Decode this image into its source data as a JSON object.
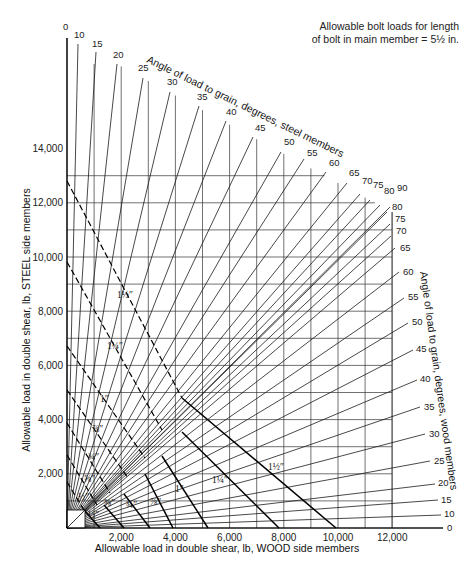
{
  "note": {
    "line1": "Allowable bolt loads for length",
    "line2": "of bolt in main member = 5½ in."
  },
  "chart_data": {
    "type": "line",
    "subtype": "nomograph",
    "title": "Allowable bolt loads for length of bolt in main member = 5½ in.",
    "xlabel": "Allowable load in double shear, lb, WOOD side members",
    "ylabel": "Allowable load in double shear, lb, STEEL side members",
    "steel_angle_title": "Angle of load to grain, degrees, steel members",
    "wood_angle_title": "Angle of load to grain, degrees, wood members",
    "xlim": [
      0,
      13000
    ],
    "ylim": [
      0,
      16500
    ],
    "x_ticks": [
      2000,
      4000,
      6000,
      8000,
      10000,
      12000
    ],
    "x_tick_labels": [
      "2,000",
      "4,000",
      "6,000",
      "8,000",
      "10,000",
      "12,000"
    ],
    "y_ticks": [
      2000,
      4000,
      6000,
      8000,
      10000,
      12000,
      14000
    ],
    "y_tick_labels": [
      "2,000",
      "4,000",
      "6,000",
      "8,000",
      "10,000",
      "12,000",
      "14,000"
    ],
    "grid": true,
    "grid_step": 1000,
    "steel_angles": [
      "0",
      "10",
      "15",
      "20",
      "25",
      "30",
      "35",
      "40",
      "45",
      "50",
      "55",
      "60",
      "65",
      "70",
      "75",
      "80",
      "90"
    ],
    "wood_angles": [
      "0",
      "10",
      "15",
      "20",
      "25",
      "30",
      "35",
      "40",
      "45",
      "50",
      "55",
      "60",
      "65",
      "70",
      "75",
      "80"
    ],
    "bolt_diameters": [
      {
        "label": "½″",
        "steel_intercept": 1000,
        "wood_intercept": 1900
      },
      {
        "label": "⅝″",
        "steel_intercept": 1700,
        "wood_intercept": 2500
      },
      {
        "label": "¾″",
        "steel_intercept": 2700,
        "wood_intercept": 3100
      },
      {
        "label": "⅞″",
        "steel_intercept": 3900,
        "wood_intercept": 3900
      },
      {
        "label": "1″",
        "steel_intercept": 5100,
        "wood_intercept": 5200
      },
      {
        "label": "1¼″",
        "steel_intercept": 6700,
        "wood_intercept": 7800
      },
      {
        "label": "1½″",
        "steel_intercept": 12800,
        "wood_intercept": 10000
      }
    ]
  },
  "geometry": {
    "origin": [
      67,
      528
    ],
    "px_per_1000": 27.1,
    "steel_rays": [
      {
        "label": "0",
        "end": [
          67,
          38
        ],
        "text": [
          63,
          30
        ]
      },
      {
        "label": "10",
        "end": [
          78,
          44
        ],
        "text": [
          74,
          38
        ]
      },
      {
        "label": "15",
        "end": [
          96,
          52
        ],
        "text": [
          92,
          47
        ]
      },
      {
        "label": "20",
        "end": [
          117,
          64
        ],
        "text": [
          113,
          58
        ]
      },
      {
        "label": "25",
        "end": [
          143,
          78
        ],
        "text": [
          138,
          71
        ]
      },
      {
        "label": "30",
        "end": [
          170,
          92
        ],
        "text": [
          167,
          85
        ]
      },
      {
        "label": "35",
        "end": [
          199,
          106
        ],
        "text": [
          197,
          100
        ]
      },
      {
        "label": "40",
        "end": [
          226,
          121
        ],
        "text": [
          226,
          115
        ]
      },
      {
        "label": "45",
        "end": [
          253,
          137
        ],
        "text": [
          255,
          131
        ]
      },
      {
        "label": "50",
        "end": [
          281,
          152
        ],
        "text": [
          284,
          145
        ]
      },
      {
        "label": "55",
        "end": [
          304,
          159
        ],
        "text": [
          307,
          156
        ]
      },
      {
        "label": "60",
        "end": [
          326,
          172
        ],
        "text": [
          329,
          166
        ]
      },
      {
        "label": "65",
        "end": [
          347,
          183
        ],
        "text": [
          349,
          176
        ]
      },
      {
        "label": "70",
        "end": [
          360,
          194
        ],
        "text": [
          362,
          184
        ]
      },
      {
        "label": "75",
        "end": [
          370,
          200
        ],
        "text": [
          373,
          188
        ]
      },
      {
        "label": "80",
        "end": [
          380,
          205
        ],
        "text": [
          384,
          194
        ]
      },
      {
        "label": "90",
        "end": [
          390,
          207
        ],
        "text": [
          397,
          191
        ]
      }
    ],
    "wood_rays": [
      {
        "label": "80",
        "end": [
          387,
          212
        ],
        "text": [
          392,
          210
        ]
      },
      {
        "label": "75",
        "end": [
          390,
          224
        ],
        "text": [
          395,
          222
        ]
      },
      {
        "label": "70",
        "end": [
          391,
          236
        ],
        "text": [
          396,
          234
        ]
      },
      {
        "label": "65",
        "end": [
          395,
          248
        ],
        "text": [
          400,
          251
        ]
      },
      {
        "label": "60",
        "end": [
          399,
          272
        ],
        "text": [
          403,
          275
        ]
      },
      {
        "label": "55",
        "end": [
          404,
          298
        ],
        "text": [
          408,
          300
        ]
      },
      {
        "label": "50",
        "end": [
          408,
          323
        ],
        "text": [
          412,
          325
        ]
      },
      {
        "label": "45",
        "end": [
          413,
          350
        ],
        "text": [
          416,
          352
        ]
      },
      {
        "label": "40",
        "end": [
          417,
          380
        ],
        "text": [
          420,
          382
        ]
      },
      {
        "label": "35",
        "end": [
          420,
          407
        ],
        "text": [
          424,
          410
        ]
      },
      {
        "label": "30",
        "end": [
          425,
          434
        ],
        "text": [
          429,
          437
        ]
      },
      {
        "label": "25",
        "end": [
          430,
          461
        ],
        "text": [
          434,
          464
        ]
      },
      {
        "label": "20",
        "end": [
          435,
          484
        ],
        "text": [
          438,
          486
        ]
      },
      {
        "label": "15",
        "end": [
          438,
          500
        ],
        "text": [
          441,
          503
        ]
      },
      {
        "label": "10",
        "end": [
          441,
          515
        ],
        "text": [
          444,
          517
        ]
      },
      {
        "label": "0",
        "end": [
          443,
          528
        ],
        "text": [
          447,
          531
        ]
      }
    ],
    "bolt_lines": [
      {
        "label": "½″",
        "pts": [
          [
            67,
            501
          ],
          [
            84,
            510
          ],
          [
            90,
            520
          ],
          [
            100,
            528
          ]
        ],
        "dash": [
          [
            67,
            501
          ],
          [
            84,
            510
          ]
        ],
        "lab": [
          88,
          518
        ]
      },
      {
        "label": "⅝″",
        "pts": [
          [
            67,
            482
          ],
          [
            90,
            497
          ],
          [
            104,
            505
          ],
          [
            118,
            520
          ],
          [
            124,
            528
          ]
        ],
        "lab": [
          104,
          506
        ]
      },
      {
        "label": "¾″",
        "pts": [
          [
            67,
            455
          ],
          [
            96,
            479
          ],
          [
            112,
            492
          ],
          [
            140,
            510
          ],
          [
            150,
            528
          ]
        ],
        "lab": [
          126,
          508
        ]
      },
      {
        "label": "⅞″",
        "pts": [
          [
            67,
            423
          ],
          [
            100,
            455
          ],
          [
            125,
            478
          ],
          [
            160,
            500
          ],
          [
            173,
            528
          ]
        ],
        "lab": [
          150,
          505
        ]
      },
      {
        "label": "1″",
        "pts": [
          [
            67,
            390
          ],
          [
            110,
            432
          ],
          [
            147,
            460
          ],
          [
            190,
            500
          ],
          [
            208,
            528
          ]
        ],
        "lab": [
          175,
          492
        ]
      },
      {
        "label": "1¼″",
        "pts": [
          [
            67,
            346
          ],
          [
            128,
            403
          ],
          [
            163,
            430
          ],
          [
            210,
            470
          ],
          [
            279,
            528
          ]
        ],
        "lab": [
          212,
          483
        ]
      },
      {
        "label": "1½″",
        "pts": [
          [
            67,
            181
          ],
          [
            180,
            365
          ],
          [
            185,
            398
          ],
          [
            260,
            460
          ],
          [
            336,
            528
          ]
        ],
        "lab": [
          268,
          470
        ]
      }
    ],
    "dashed_lines": [
      {
        "pts": [
          [
            67,
            181
          ],
          [
            182,
            398
          ]
        ]
      },
      {
        "pts": [
          [
            67,
            262
          ],
          [
            162,
            430
          ]
        ]
      },
      {
        "pts": [
          [
            67,
            346
          ],
          [
            145,
            458
          ]
        ]
      },
      {
        "pts": [
          [
            67,
            390
          ],
          [
            128,
            478
          ]
        ]
      },
      {
        "pts": [
          [
            67,
            423
          ],
          [
            110,
            493
          ]
        ]
      },
      {
        "pts": [
          [
            67,
            455
          ],
          [
            97,
            505
          ]
        ]
      },
      {
        "pts": [
          [
            67,
            482
          ],
          [
            84,
            510
          ]
        ]
      }
    ],
    "small_labels": [
      {
        "label": "1½″",
        "at": [
          117,
          298
        ]
      },
      {
        "label": "1¼″",
        "at": [
          107,
          349
        ]
      },
      {
        "label": "1″",
        "at": [
          100,
          402
        ]
      },
      {
        "label": "⅞″",
        "at": [
          92,
          432
        ]
      },
      {
        "label": "¾″",
        "at": [
          88,
          460
        ]
      },
      {
        "label": "⅝″",
        "at": [
          84,
          482
        ]
      },
      {
        "label": "½″",
        "at": [
          78,
          500
        ]
      }
    ]
  }
}
